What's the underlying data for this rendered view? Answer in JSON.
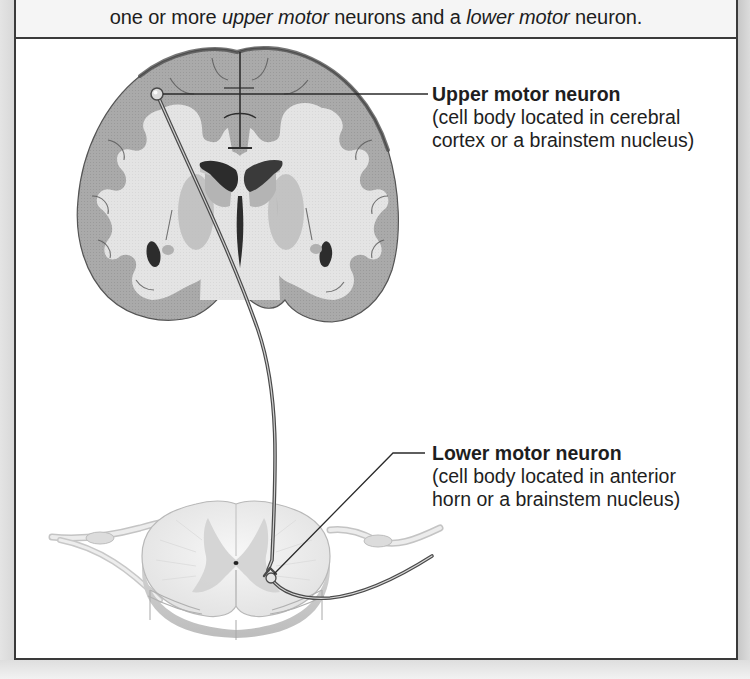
{
  "caption": {
    "parts": [
      {
        "text": "one or more ",
        "italic": false
      },
      {
        "text": "upper motor",
        "italic": true
      },
      {
        "text": " neurons and a ",
        "italic": false
      },
      {
        "text": "lower motor",
        "italic": true
      },
      {
        "text": " neuron.",
        "italic": false
      }
    ],
    "p0": "one or more ",
    "p1": "upper motor",
    "p2": " neurons and a ",
    "p3": "lower motor",
    "p4": " neuron."
  },
  "labels": {
    "upper": {
      "title": "Upper motor neuron",
      "desc_line1": "(cell body located in cerebral",
      "desc_line2": "cortex or a brainstem nucleus)"
    },
    "lower": {
      "title": "Lower motor neuron",
      "desc_line1": "(cell body located in anterior",
      "desc_line2": "horn or a brainstem nucleus)"
    }
  },
  "figure": {
    "structures": [
      "cerebrum (coronal section)",
      "lateral ventricles",
      "spinal cord (cross section)",
      "spinal nerves",
      "upper motor neuron axon",
      "lower motor neuron axon"
    ],
    "colors": {
      "cortex_gray": "#a9a9a9",
      "white_matter": "#e6e6e6",
      "ventricle": "#2e2e2e",
      "outline": "#3a3a3a",
      "spinal_cord": "#efefef"
    }
  }
}
